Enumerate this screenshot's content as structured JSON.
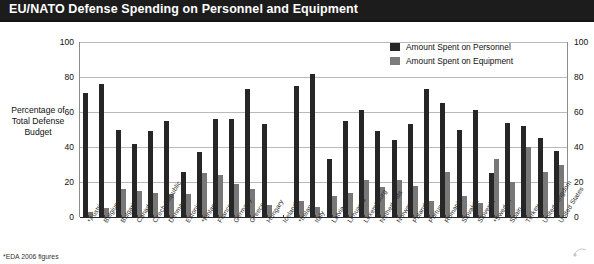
{
  "header": {
    "title": "EU/NATO Defense Spending on Personnel and Equipment"
  },
  "axis": {
    "y_caption_line1": "Percentage of",
    "y_caption_line2": "Total Defense",
    "y_caption_line3": "Budget"
  },
  "legend": {
    "items": [
      {
        "label": "Amount Spent on Personnel",
        "color": "#262626"
      },
      {
        "label": "Amount Spent on Equipment",
        "color": "#7c7c7c"
      }
    ]
  },
  "footnote": "*EDA 2006 figures",
  "colors": {
    "title_bar": "#1c1c1c",
    "personnel": "#262626",
    "equipment": "#787878",
    "gridline": "#b9b9b9"
  },
  "chart_data": {
    "type": "bar",
    "title": "EU/NATO Defense Spending on Personnel and Equipment",
    "xlabel": "",
    "ylabel": "Percentage of Total Defense Budget",
    "ylim": [
      0,
      100
    ],
    "yticks": [
      0,
      20,
      40,
      60,
      80,
      100
    ],
    "ytick_labels": [
      "0",
      "20",
      "40",
      "60",
      "80",
      "100"
    ],
    "grid": true,
    "legend_position": "top-right",
    "dual_y_axis": true,
    "categories": [
      "*Austria",
      "Belgium",
      "Bulgaria",
      "Canada",
      "Czech Republic",
      "Denmark",
      "Estonia",
      "*Finland",
      "France",
      "Germany",
      "Greece",
      "Hungary",
      "Iceland",
      "*Ireland",
      "Italy",
      "Latvia",
      "Lithuania",
      "Luxembourg",
      "Netherlands",
      "Norway",
      "Poland",
      "Portugal",
      "Romania",
      "Slovakia",
      "Slovenia",
      "*Sweden",
      "Spain",
      "Turkey",
      "United Kingdom",
      "United States"
    ],
    "series": [
      {
        "name": "Amount Spent on Personnel",
        "color": "#262626",
        "values": [
          71,
          76,
          50,
          42,
          49,
          55,
          26,
          37,
          56,
          56,
          73,
          53,
          0,
          75,
          82,
          33,
          55,
          61,
          49,
          44,
          53,
          73,
          65,
          50,
          61,
          25,
          54,
          52,
          45,
          38
        ]
      },
      {
        "name": "Amount Spent on Equipment",
        "color": "#787878",
        "values": [
          3,
          5,
          16,
          15,
          14,
          13,
          13,
          25,
          24,
          19,
          16,
          7,
          0,
          9,
          6,
          12,
          14,
          21,
          17,
          21,
          18,
          9,
          26,
          12,
          8,
          33,
          20,
          40,
          26,
          30
        ]
      }
    ]
  }
}
